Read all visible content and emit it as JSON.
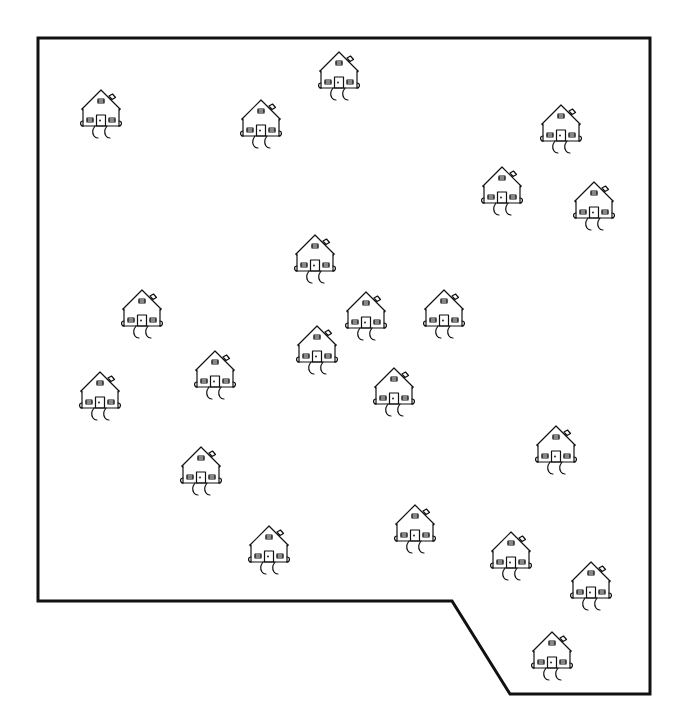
{
  "diagram": {
    "type": "map-region-with-houses",
    "stroke_color": "#111111",
    "background_color": "#ffffff",
    "boundary": {
      "label": "region-boundary",
      "points": [
        [
          38,
          38
        ],
        [
          650,
          38
        ],
        [
          650,
          694
        ],
        [
          510,
          694
        ],
        [
          452,
          601
        ],
        [
          38,
          601
        ]
      ]
    },
    "house_icon": "house-icon",
    "house_count": 21,
    "houses": [
      {
        "id": 1,
        "peak_x": 101,
        "peak_y": 90
      },
      {
        "id": 2,
        "peak_x": 261,
        "peak_y": 100
      },
      {
        "id": 3,
        "peak_x": 339,
        "peak_y": 52
      },
      {
        "id": 4,
        "peak_x": 561,
        "peak_y": 105
      },
      {
        "id": 5,
        "peak_x": 502,
        "peak_y": 167
      },
      {
        "id": 6,
        "peak_x": 594,
        "peak_y": 182
      },
      {
        "id": 7,
        "peak_x": 315,
        "peak_y": 235
      },
      {
        "id": 8,
        "peak_x": 142,
        "peak_y": 290
      },
      {
        "id": 9,
        "peak_x": 366,
        "peak_y": 292
      },
      {
        "id": 10,
        "peak_x": 444,
        "peak_y": 290
      },
      {
        "id": 11,
        "peak_x": 317,
        "peak_y": 326
      },
      {
        "id": 12,
        "peak_x": 215,
        "peak_y": 351
      },
      {
        "id": 13,
        "peak_x": 100,
        "peak_y": 372
      },
      {
        "id": 14,
        "peak_x": 394,
        "peak_y": 368
      },
      {
        "id": 15,
        "peak_x": 556,
        "peak_y": 426
      },
      {
        "id": 16,
        "peak_x": 201,
        "peak_y": 447
      },
      {
        "id": 17,
        "peak_x": 269,
        "peak_y": 526
      },
      {
        "id": 18,
        "peak_x": 415,
        "peak_y": 505
      },
      {
        "id": 19,
        "peak_x": 511,
        "peak_y": 532
      },
      {
        "id": 20,
        "peak_x": 591,
        "peak_y": 562
      },
      {
        "id": 21,
        "peak_x": 552,
        "peak_y": 632
      }
    ]
  }
}
